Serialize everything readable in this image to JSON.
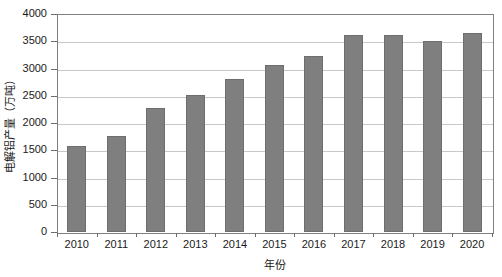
{
  "chart_data": {
    "type": "bar",
    "title": "",
    "xlabel": "年份",
    "ylabel": "电解铝产量（万吨）",
    "categories": [
      "2010",
      "2011",
      "2012",
      "2013",
      "2014",
      "2015",
      "2016",
      "2017",
      "2018",
      "2019",
      "2020"
    ],
    "values": [
      1570,
      1760,
      2270,
      2510,
      2800,
      3060,
      3230,
      3620,
      3620,
      3510,
      3650
    ],
    "ylim": [
      0,
      4000
    ],
    "yticks": [
      0,
      500,
      1000,
      1500,
      2000,
      2500,
      3000,
      3500,
      4000
    ],
    "ytick_labels": [
      "0",
      "500",
      "1000",
      "1500",
      "2000",
      "2500",
      "3000",
      "3500",
      "4000"
    ],
    "grid": true,
    "legend": "none",
    "series": [
      {
        "name": "电解铝产量",
        "color": "#7f7f7f",
        "values": [
          1570,
          1760,
          2270,
          2510,
          2800,
          3060,
          3230,
          3620,
          3620,
          3510,
          3650
        ]
      }
    ]
  },
  "colors": {
    "bar": "#7f7f7f",
    "bar_edge": "#6e6e6e",
    "gridline": "#c8c8c8",
    "frame": "#808080",
    "text": "#1a1a1a",
    "background": "#ffffff"
  }
}
